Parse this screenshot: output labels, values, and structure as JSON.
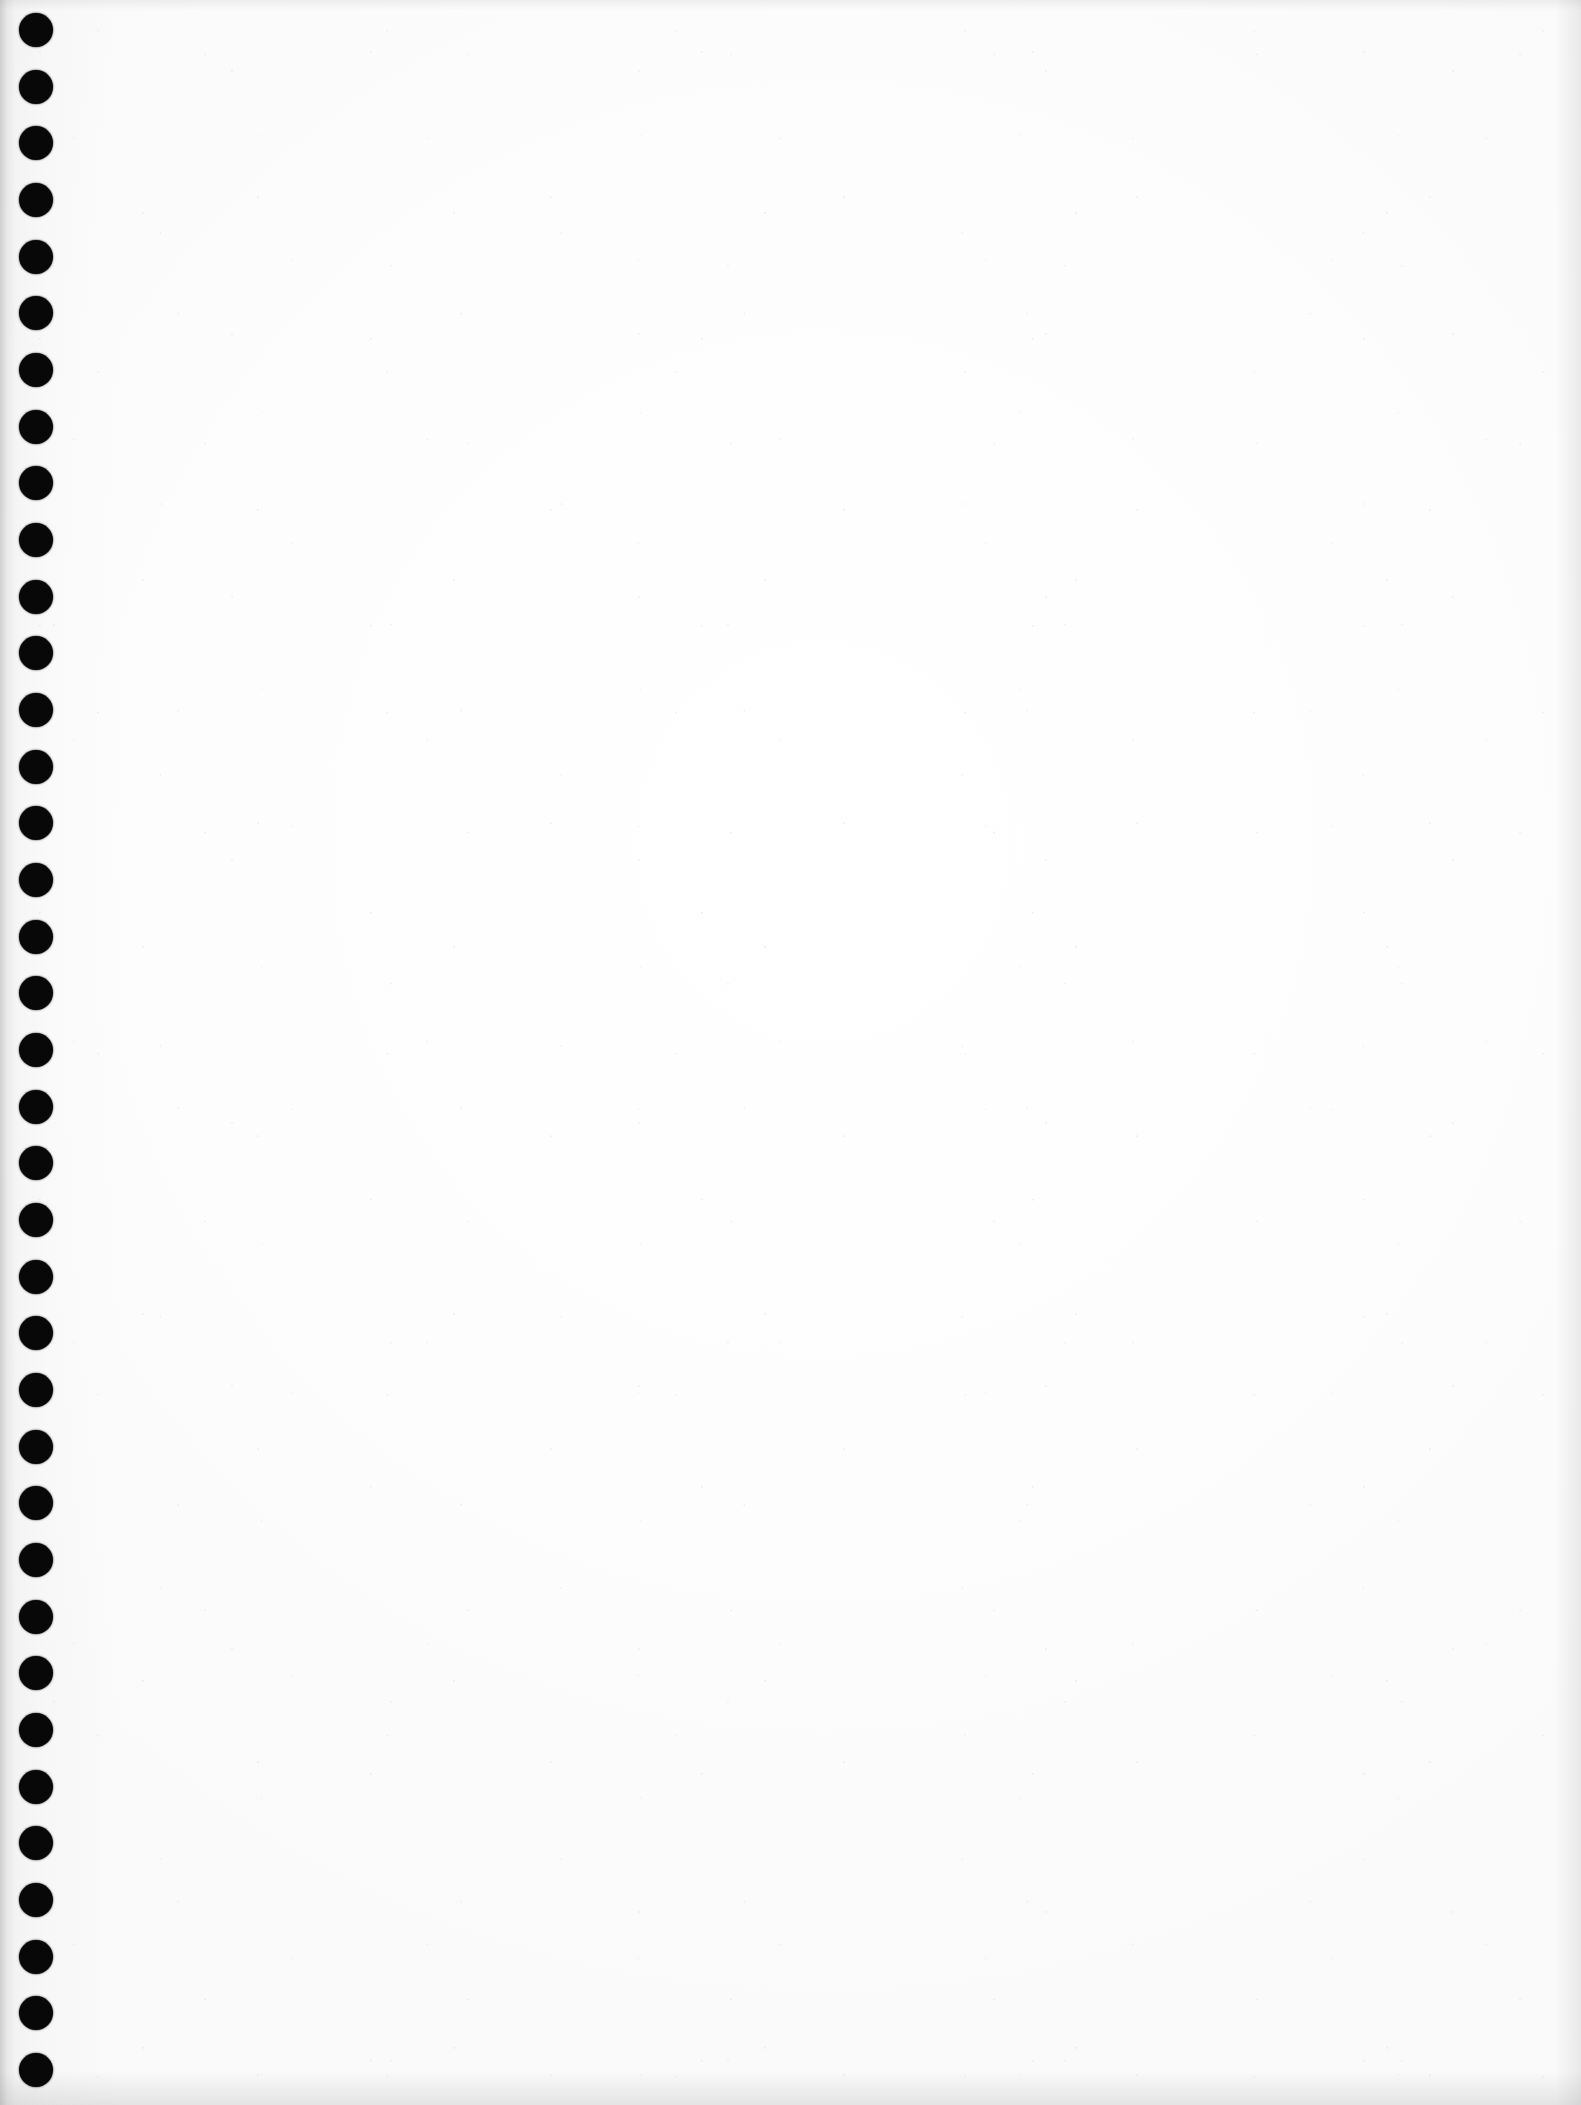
{
  "document": {
    "kind": "scanned-page",
    "appearance": "blank",
    "page_width_px": 1581,
    "page_height_px": 2105,
    "paper_color": "#ffffff",
    "ink_color": "#080808",
    "visible_text": "",
    "body_text": "",
    "page_number": "",
    "heading": "",
    "caption": ""
  },
  "binding": {
    "name": "spiral-binding-holes",
    "hole_color": "#080808",
    "hole_count": 37,
    "hole_diameter_px": 34,
    "hole_center_x_px": 36,
    "first_hole_center_y_px": 30,
    "hole_spacing_px": 56.7,
    "holes": [
      {
        "index": 1,
        "cx": 36,
        "cy": 30,
        "d": 34
      },
      {
        "index": 2,
        "cx": 36,
        "cy": 87,
        "d": 34
      },
      {
        "index": 3,
        "cx": 36,
        "cy": 143,
        "d": 34
      },
      {
        "index": 4,
        "cx": 36,
        "cy": 200,
        "d": 34
      },
      {
        "index": 5,
        "cx": 36,
        "cy": 257,
        "d": 34
      },
      {
        "index": 6,
        "cx": 36,
        "cy": 313,
        "d": 34
      },
      {
        "index": 7,
        "cx": 36,
        "cy": 370,
        "d": 34
      },
      {
        "index": 8,
        "cx": 36,
        "cy": 427,
        "d": 34
      },
      {
        "index": 9,
        "cx": 36,
        "cy": 483,
        "d": 34
      },
      {
        "index": 10,
        "cx": 36,
        "cy": 540,
        "d": 34
      },
      {
        "index": 11,
        "cx": 36,
        "cy": 597,
        "d": 34
      },
      {
        "index": 12,
        "cx": 36,
        "cy": 653,
        "d": 34
      },
      {
        "index": 13,
        "cx": 36,
        "cy": 710,
        "d": 34
      },
      {
        "index": 14,
        "cx": 36,
        "cy": 767,
        "d": 34
      },
      {
        "index": 15,
        "cx": 36,
        "cy": 823,
        "d": 34
      },
      {
        "index": 16,
        "cx": 36,
        "cy": 880,
        "d": 34
      },
      {
        "index": 17,
        "cx": 36,
        "cy": 937,
        "d": 34
      },
      {
        "index": 18,
        "cx": 36,
        "cy": 993,
        "d": 34
      },
      {
        "index": 19,
        "cx": 36,
        "cy": 1050,
        "d": 34
      },
      {
        "index": 20,
        "cx": 36,
        "cy": 1107,
        "d": 34
      },
      {
        "index": 21,
        "cx": 36,
        "cy": 1163,
        "d": 34
      },
      {
        "index": 22,
        "cx": 36,
        "cy": 1220,
        "d": 34
      },
      {
        "index": 23,
        "cx": 36,
        "cy": 1277,
        "d": 34
      },
      {
        "index": 24,
        "cx": 36,
        "cy": 1333,
        "d": 34
      },
      {
        "index": 25,
        "cx": 36,
        "cy": 1390,
        "d": 34
      },
      {
        "index": 26,
        "cx": 36,
        "cy": 1447,
        "d": 34
      },
      {
        "index": 27,
        "cx": 36,
        "cy": 1503,
        "d": 34
      },
      {
        "index": 28,
        "cx": 36,
        "cy": 1560,
        "d": 34
      },
      {
        "index": 29,
        "cx": 36,
        "cy": 1617,
        "d": 34
      },
      {
        "index": 30,
        "cx": 36,
        "cy": 1673,
        "d": 34
      },
      {
        "index": 31,
        "cx": 36,
        "cy": 1730,
        "d": 34
      },
      {
        "index": 32,
        "cx": 36,
        "cy": 1787,
        "d": 34
      },
      {
        "index": 33,
        "cx": 36,
        "cy": 1843,
        "d": 34
      },
      {
        "index": 34,
        "cx": 36,
        "cy": 1900,
        "d": 34
      },
      {
        "index": 35,
        "cx": 36,
        "cy": 1957,
        "d": 34
      },
      {
        "index": 36,
        "cx": 36,
        "cy": 2013,
        "d": 34
      },
      {
        "index": 37,
        "cx": 36,
        "cy": 2070,
        "d": 34
      }
    ]
  }
}
